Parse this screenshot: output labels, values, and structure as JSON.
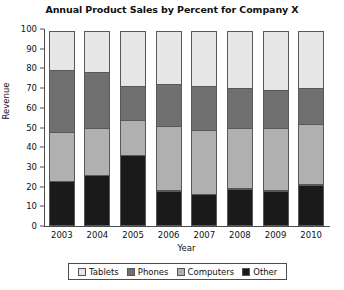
{
  "chart_data": {
    "type": "bar",
    "subtype": "stacked-percent",
    "title": "Annual Product Sales by Percent for Company X",
    "xlabel": "Year",
    "ylabel": "Revenue",
    "ylim": [
      0,
      100
    ],
    "yticks": [
      0,
      10,
      20,
      30,
      40,
      50,
      60,
      70,
      80,
      90,
      100
    ],
    "grid": false,
    "legend_position": "bottom",
    "categories": [
      "2003",
      "2004",
      "2005",
      "2006",
      "2007",
      "2008",
      "2009",
      "2010"
    ],
    "series": [
      {
        "name": "Other",
        "color": "#1a1a1a",
        "values": [
          23,
          26,
          36,
          18,
          16,
          19,
          18,
          21
        ]
      },
      {
        "name": "Computers",
        "color": "#b0b0b0",
        "values": [
          25,
          24,
          18,
          33,
          33,
          31,
          32,
          31
        ]
      },
      {
        "name": "Phones",
        "color": "#707070",
        "values": [
          32,
          29,
          18,
          22,
          23,
          21,
          20,
          19
        ]
      },
      {
        "name": "Tablets",
        "color": "#e6e6e6",
        "values": [
          20,
          21,
          28,
          27,
          28,
          29,
          30,
          29
        ]
      }
    ]
  },
  "legend": {
    "items": [
      {
        "label": "Tablets",
        "color": "#e6e6e6"
      },
      {
        "label": "Phones",
        "color": "#707070"
      },
      {
        "label": "Computers",
        "color": "#b0b0b0"
      },
      {
        "label": "Other",
        "color": "#1a1a1a"
      }
    ]
  }
}
